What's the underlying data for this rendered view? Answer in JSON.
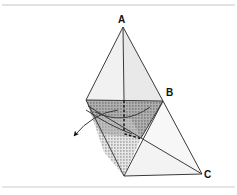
{
  "figure": {
    "caption_title": "",
    "background_color": "#ffffff",
    "frame": {
      "top_rule_y": 5,
      "bottom_rule_y": 187,
      "rule_color": "#d9d9d9",
      "rule_thickness": 1.2
    },
    "stroke_color": "#3a3a3a",
    "dotted_color": "#111111",
    "labels": [
      {
        "id": "A",
        "text": "A",
        "x": 118,
        "y": 15,
        "role": "apex-vertex"
      },
      {
        "id": "B",
        "text": "B",
        "x": 166,
        "y": 88,
        "role": "right-vertex"
      },
      {
        "id": "C",
        "text": "C",
        "x": 204,
        "y": 170,
        "role": "lower-right-vertex"
      }
    ],
    "points": {
      "A": {
        "x": 123,
        "y": 27
      },
      "B": {
        "x": 163,
        "y": 101
      },
      "C": {
        "x": 202,
        "y": 174
      },
      "upper_left": {
        "x": 86,
        "y": 100
      },
      "cone_apex": {
        "x": 124,
        "y": 176
      },
      "base_right": {
        "x": 141,
        "y": 138
      },
      "arrow_tip": {
        "x": 64,
        "y": 143
      },
      "arrow_tail": {
        "x": 117,
        "y": 112
      }
    },
    "faces": [
      {
        "name": "upper-left-face",
        "fill": "#f0f0f0",
        "points": "123,27 86,100 124,100"
      },
      {
        "name": "upper-right-face",
        "fill": "#e8e8e8",
        "points": "123,27 124,100 163,101"
      },
      {
        "name": "top-band-left",
        "fill": "#b3b3b3",
        "points": "86,100 124,100 130,116 96,118"
      },
      {
        "name": "top-band-right",
        "fill": "#a8a8a8",
        "points": "124,100 163,101 141,138 130,116"
      },
      {
        "name": "cone-stipple-body",
        "fill": "#cfcfcf",
        "points": "96,118 130,116 141,138 124,176 104,150"
      },
      {
        "name": "lower-right-face",
        "fill": "#f2f2f2",
        "points": "163,101 202,174 124,176"
      },
      {
        "name": "lower-right-wedge",
        "fill": "#f6f6f6",
        "points": "141,138 202,174 163,101"
      }
    ],
    "edges": [
      {
        "name": "edge-A-to-upper-left",
        "d": "M 123 27 L 86 100"
      },
      {
        "name": "edge-A-to-B",
        "d": "M 123 27 L 163 101"
      },
      {
        "name": "edge-A-axis-vertical",
        "d": "M 123 27 L 124 100"
      },
      {
        "name": "edge-top-horizontal",
        "d": "M 86 100 L 163 101"
      },
      {
        "name": "edge-upper-left-to-cone-apex",
        "d": "M 86 100 L 124 176"
      },
      {
        "name": "edge-B-to-cone-apex",
        "d": "M 163 101 L 124 176"
      },
      {
        "name": "edge-B-to-C",
        "d": "M 163 101 L 202 174"
      },
      {
        "name": "edge-cone-apex-to-C",
        "d": "M 124 176 L 202 174"
      },
      {
        "name": "edge-base-right-to-C",
        "d": "M 141 138 L 202 174"
      },
      {
        "name": "edge-base-right-to-B",
        "d": "M 141 138 L 163 101"
      },
      {
        "name": "edge-cut-plane-left",
        "d": "M 88 105 L 141 138"
      },
      {
        "name": "edge-cut-plane-upper",
        "d": "M 96 118 L 163 101"
      }
    ],
    "curves": [
      {
        "name": "ellipse-cut-arc",
        "d": "M 96 113 Q 124 125 148 110"
      },
      {
        "name": "cone-arc-left",
        "d": "M 86 112 Q 108 124 130 134"
      },
      {
        "name": "arrow-leader-curve",
        "d": "M 117 112 Q 92 114 70 139"
      }
    ],
    "dotted_segments": [
      {
        "name": "dotted-vertical-axis",
        "d": "M 124 100 L 124 133",
        "dasharray": "1.5 3"
      },
      {
        "name": "dotted-slant-axis",
        "d": "M 124 133 L 141 138",
        "dasharray": "1.5 3"
      }
    ],
    "arrow": {
      "name": "pointer-arrow",
      "tip_x": 64,
      "tip_y": 143,
      "fill": "#111111",
      "polygon": "64,143 80,135 78,146 74,150"
    },
    "stipple": {
      "dot_color": "#6b6b6b",
      "dot_spacing": 3,
      "dot_radius": 0.6
    }
  }
}
